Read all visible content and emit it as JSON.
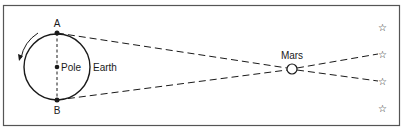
{
  "diagram": {
    "labels": {
      "point_a": "A",
      "point_b": "B",
      "pole": "Pole",
      "earth": "Earth",
      "mars": "Mars"
    },
    "stars": [
      {
        "name": "star-1",
        "glyph": "☆"
      },
      {
        "name": "star-2",
        "glyph": "☆"
      },
      {
        "name": "star-3",
        "glyph": "☆"
      },
      {
        "name": "star-4",
        "glyph": "☆"
      }
    ],
    "colors": {
      "line": "#1a1a1a",
      "frame": "#555555",
      "background": "#ffffff"
    }
  }
}
